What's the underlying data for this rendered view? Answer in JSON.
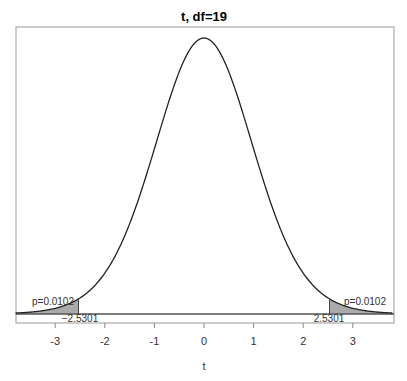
{
  "chart_data": {
    "type": "area",
    "title": "t, df=19",
    "xlabel": "t",
    "ylabel": "",
    "distribution": "Student t",
    "df": 19,
    "xlim": [
      -3.8,
      3.8
    ],
    "x_ticks": [
      "-3",
      "-2",
      "-1",
      "0",
      "1",
      "2",
      "3"
    ],
    "x_tick_values": [
      -3,
      -2,
      -1,
      0,
      1,
      2,
      3
    ],
    "shaded_regions": [
      {
        "from": -3.8,
        "to": -2.5301,
        "label": "p=0.0102"
      },
      {
        "from": 2.5301,
        "to": 3.8,
        "label": "p=0.0102"
      }
    ],
    "critical_values": [
      {
        "value": -2.5301,
        "label": "-2.5301"
      },
      {
        "value": 2.5301,
        "label": "2.5301"
      }
    ],
    "grid": false,
    "legend": null
  },
  "labels": {
    "title": "t, df=19",
    "xlabel": "t",
    "left_p": "p=0.0102",
    "right_p": "p=0.0102",
    "left_crit": "−2.5301",
    "right_crit": "2.5301",
    "ticks": [
      "-3",
      "-2",
      "-1",
      "0",
      "1",
      "2",
      "3"
    ]
  },
  "colors": {
    "curve": "#222222",
    "shade": "#aaaaaa",
    "border": "#999999"
  }
}
